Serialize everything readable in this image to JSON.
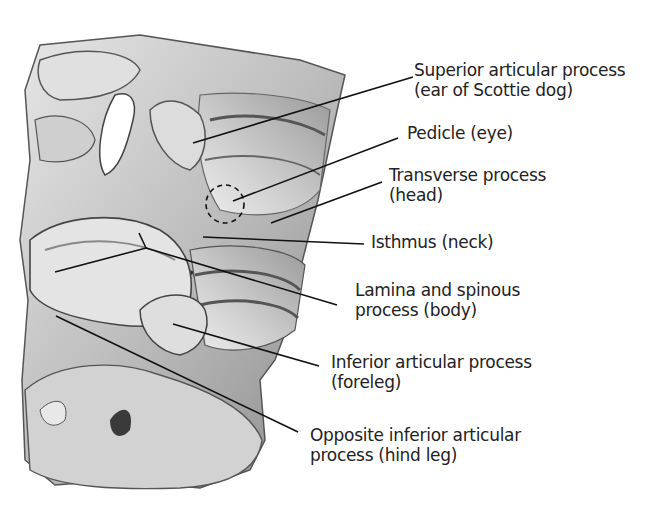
{
  "figure": {
    "labels": [
      {
        "id": "superior-articular-process",
        "line1": "Superior articular process",
        "line2": "(ear of Scottie dog)"
      },
      {
        "id": "pedicle",
        "line1": "Pedicle (eye)",
        "line2": ""
      },
      {
        "id": "transverse-process",
        "line1": "Transverse process",
        "line2": "(head)"
      },
      {
        "id": "isthmus",
        "line1": "Isthmus (neck)",
        "line2": ""
      },
      {
        "id": "lamina-spinous-process",
        "line1": "Lamina and spinous",
        "line2": "process (body)"
      },
      {
        "id": "inferior-articular-process",
        "line1": "Inferior articular process",
        "line2": "(foreleg)"
      },
      {
        "id": "opposite-inferior-articular-process",
        "line1": "Opposite inferior articular",
        "line2": "process (hind leg)"
      }
    ]
  },
  "colors": {
    "background": "#ffffff",
    "text": "#222222",
    "leader_line": "#111111",
    "bone_light": "#d9d9d9",
    "bone_mid": "#a8a8a8",
    "bone_dark": "#4a4a4a"
  }
}
